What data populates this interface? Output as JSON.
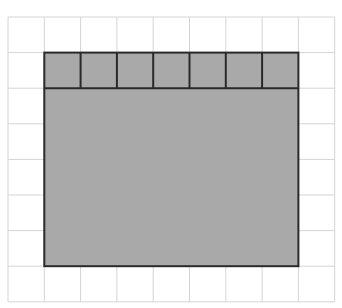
{
  "diagram": {
    "grid": {
      "columns": 9,
      "rows": 8,
      "origin_x": 8,
      "origin_y": 17,
      "cell_w": 36.3,
      "cell_h": 35.6,
      "line_color": "#d4d4d4"
    },
    "shaded_rectangle": {
      "col_start": 1,
      "row_start": 1,
      "width_units": 7,
      "height_units": 6,
      "fill": "#a9a9a9",
      "stroke": "#2a2a2a"
    },
    "top_row_unit_squares": 7
  }
}
